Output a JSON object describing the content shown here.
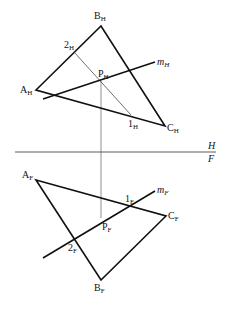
{
  "diagram": {
    "folding_line": {
      "top_label": "H",
      "bottom_label": "F"
    },
    "top_view": {
      "vertices": {
        "A": {
          "label": "A",
          "sub": "H",
          "x": 36,
          "y": 90
        },
        "B": {
          "label": "B",
          "sub": "H",
          "x": 101,
          "y": 26
        },
        "C": {
          "label": "C",
          "sub": "H",
          "x": 165,
          "y": 126
        }
      },
      "point_1": {
        "label": "1",
        "sub": "H",
        "x": 131,
        "y": 115
      },
      "point_2": {
        "label": "2",
        "sub": "H",
        "x": 74,
        "y": 52
      },
      "point_P": {
        "label": "P",
        "sub": "H",
        "x": 101,
        "y": 81
      },
      "line_m": {
        "label": "m",
        "sub": "H",
        "x1": 43,
        "y1": 99,
        "x2": 155,
        "y2": 62
      }
    },
    "front_view": {
      "vertices": {
        "A": {
          "label": "A",
          "sub": "F",
          "x": 36,
          "y": 180
        },
        "B": {
          "label": "B",
          "sub": "F",
          "x": 101,
          "y": 280
        },
        "C": {
          "label": "C",
          "sub": "F",
          "x": 166,
          "y": 216
        }
      },
      "point_1": {
        "label": "1",
        "sub": "F",
        "x": 131,
        "y": 206
      },
      "point_2": {
        "label": "2",
        "sub": "F",
        "x": 75,
        "y": 239
      },
      "point_P": {
        "label": "P",
        "sub": "F",
        "x": 101,
        "y": 218
      },
      "line_m": {
        "label": "m",
        "sub": "F",
        "x1": 43,
        "y1": 258,
        "x2": 155,
        "y2": 191
      }
    }
  }
}
